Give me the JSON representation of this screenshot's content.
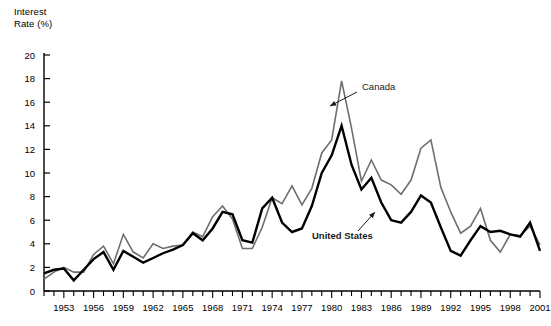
{
  "chart_data": {
    "type": "line",
    "title": "",
    "subtitle": "",
    "xlabel": "",
    "ylabel": "Interest\nRate (%)",
    "ylim": [
      0,
      20
    ],
    "ytick_step": 2,
    "yticks": [
      0,
      2,
      4,
      6,
      8,
      10,
      12,
      14,
      16,
      18,
      20
    ],
    "ytick_labels": [
      "0",
      "2",
      "4",
      "6",
      "8",
      "10",
      "12",
      "14",
      "16",
      "18",
      "20"
    ],
    "xlim": [
      1951,
      2001
    ],
    "xtick_step": 1,
    "xtick_labels": [
      "1953",
      "1956",
      "1959",
      "1962",
      "1965",
      "1968",
      "1971",
      "1974",
      "1977",
      "1980",
      "1983",
      "1986",
      "1989",
      "1992",
      "1995",
      "1998",
      "2001"
    ],
    "xtick_label_years": [
      1953,
      1956,
      1959,
      1962,
      1965,
      1968,
      1971,
      1974,
      1977,
      1980,
      1983,
      1986,
      1989,
      1992,
      1995,
      1998,
      2001
    ],
    "grid": false,
    "legend_position": "inline-annotations",
    "x": [
      1951,
      1952,
      1953,
      1954,
      1955,
      1956,
      1957,
      1958,
      1959,
      1960,
      1961,
      1962,
      1963,
      1964,
      1965,
      1966,
      1967,
      1968,
      1969,
      1970,
      1971,
      1972,
      1973,
      1974,
      1975,
      1976,
      1977,
      1978,
      1979,
      1980,
      1981,
      1982,
      1983,
      1984,
      1985,
      1986,
      1987,
      1988,
      1989,
      1990,
      1991,
      1992,
      1993,
      1994,
      1995,
      1996,
      1997,
      1998,
      1999,
      2000,
      2001
    ],
    "series": [
      {
        "name": "Canada",
        "color": "#6e6e6e",
        "line_width": 1.6,
        "values": [
          1.0,
          1.6,
          2.0,
          1.6,
          1.6,
          3.1,
          3.8,
          2.3,
          4.8,
          3.3,
          2.8,
          4.0,
          3.6,
          3.8,
          3.9,
          5.0,
          4.6,
          6.3,
          7.2,
          6.1,
          3.6,
          3.6,
          5.4,
          7.9,
          7.4,
          8.9,
          7.3,
          8.7,
          11.7,
          12.8,
          17.8,
          13.8,
          9.3,
          11.1,
          9.4,
          9.0,
          8.2,
          9.4,
          12.1,
          12.8,
          8.8,
          6.7,
          4.9,
          5.5,
          7.0,
          4.3,
          3.3,
          4.8,
          4.7,
          5.5,
          3.9
        ]
      },
      {
        "name": "United States",
        "color": "#000000",
        "line_width": 2.4,
        "values": [
          1.5,
          1.8,
          1.9,
          0.9,
          1.8,
          2.7,
          3.3,
          1.8,
          3.4,
          2.9,
          2.4,
          2.8,
          3.2,
          3.5,
          3.9,
          4.9,
          4.3,
          5.3,
          6.7,
          6.5,
          4.3,
          4.1,
          7.0,
          7.9,
          5.8,
          5.0,
          5.3,
          7.2,
          10.0,
          11.5,
          14.0,
          10.7,
          8.6,
          9.6,
          7.5,
          6.0,
          5.8,
          6.7,
          8.1,
          7.5,
          5.4,
          3.4,
          3.0,
          4.3,
          5.5,
          5.0,
          5.1,
          4.8,
          4.6,
          5.8,
          3.4
        ]
      }
    ],
    "annotations": [
      {
        "text": "Canada",
        "target_year": 1981,
        "target_value": 17.0,
        "label_x": 362,
        "label_y": 90,
        "arrow_from_x": 357,
        "arrow_from_y": 92,
        "arrow_to_x": 330,
        "arrow_to_y": 106,
        "bold": false
      },
      {
        "text": "United States",
        "target_year": 1985,
        "target_value": 8.6,
        "label_x": 312,
        "label_y": 239,
        "arrow_from_x": 358,
        "arrow_from_y": 231,
        "arrow_to_x": 375,
        "arrow_to_y": 212,
        "bold": true
      }
    ]
  }
}
